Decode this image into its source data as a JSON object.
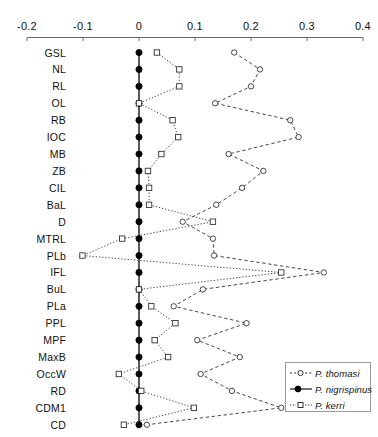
{
  "chart_data": {
    "type": "line",
    "orientation": "horizontal",
    "title": "",
    "subtitle": "",
    "xlabel": "",
    "ylabel": "",
    "xlim": [
      -0.2,
      0.4
    ],
    "xticks": [
      -0.2,
      -0.1,
      0,
      0.1,
      0.2,
      0.3,
      0.4
    ],
    "xtick_labels": [
      "-0.2",
      "-0.1",
      "0",
      "0.1",
      "0.2",
      "0.3",
      "0.4"
    ],
    "grid": false,
    "legend_position": "bottom-right",
    "categories": [
      "GSL",
      "NL",
      "RL",
      "OL",
      "RB",
      "IOC",
      "MB",
      "ZB",
      "CIL",
      "BaL",
      "D",
      "MTRL",
      "PLb",
      "IFL",
      "BuL",
      "PLa",
      "PPL",
      "MPF",
      "MaxB",
      "OccW",
      "RD",
      "CDM1",
      "CD"
    ],
    "series": [
      {
        "name": "P. thomasi",
        "marker": "open-circle",
        "linestyle": "dashed",
        "color": "#333333",
        "values": [
          0.17,
          0.216,
          0.2,
          0.136,
          0.27,
          0.285,
          0.16,
          0.222,
          0.184,
          0.138,
          0.078,
          0.132,
          0.134,
          0.33,
          0.114,
          0.062,
          0.192,
          0.104,
          0.18,
          0.11,
          0.166,
          0.254,
          0.014
        ]
      },
      {
        "name": "P. nigrispinus",
        "marker": "filled-circle",
        "linestyle": "solid",
        "color": "#000000",
        "values": [
          0.0,
          0.0,
          0.0,
          0.0,
          0.0,
          0.0,
          0.0,
          0.0,
          0.0,
          0.0,
          0.0,
          0.0,
          0.0,
          0.0,
          0.0,
          0.0,
          0.0,
          0.0,
          0.0,
          0.0,
          0.0,
          0.0,
          0.0
        ]
      },
      {
        "name": "P. kerri",
        "marker": "open-square",
        "linestyle": "dotted",
        "color": "#333333",
        "values": [
          0.032,
          0.072,
          0.072,
          0.0,
          0.06,
          0.07,
          0.04,
          0.016,
          0.018,
          0.018,
          0.132,
          -0.03,
          -0.101,
          0.254,
          0.0,
          0.022,
          0.065,
          0.028,
          0.052,
          -0.036,
          0.004,
          0.098,
          -0.027
        ]
      }
    ]
  },
  "legend": {
    "items": [
      {
        "label": "P. thomasi",
        "marker": "open-circle",
        "linestyle": "dashed"
      },
      {
        "label": "P. nigrispinus",
        "marker": "filled-circle",
        "linestyle": "solid"
      },
      {
        "label": "P. kerri",
        "marker": "open-square",
        "linestyle": "dotted"
      }
    ]
  }
}
